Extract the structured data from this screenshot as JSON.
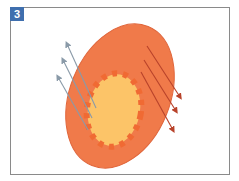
{
  "figure": {
    "panel_label": "3",
    "colors": {
      "badge": "#3f6fae",
      "outer_cell": "#f07a4a",
      "outer_cell_stroke": "#e0653a",
      "inner_core": "#fcc468",
      "membrane_squares": "#f06a33",
      "incoming_arrows": "#8a9aa8",
      "outgoing_arrows": "#b8422a",
      "frame": "#8a8a8a"
    },
    "elements": {
      "outer_ellipse": "large orange tilted ellipse",
      "inner_ellipse": "yellow core with dashed orange square border",
      "left_arrows": "3 grey-blue arrows pointing up-left",
      "right_arrows": "3 dark red arrows pointing down-right"
    }
  }
}
